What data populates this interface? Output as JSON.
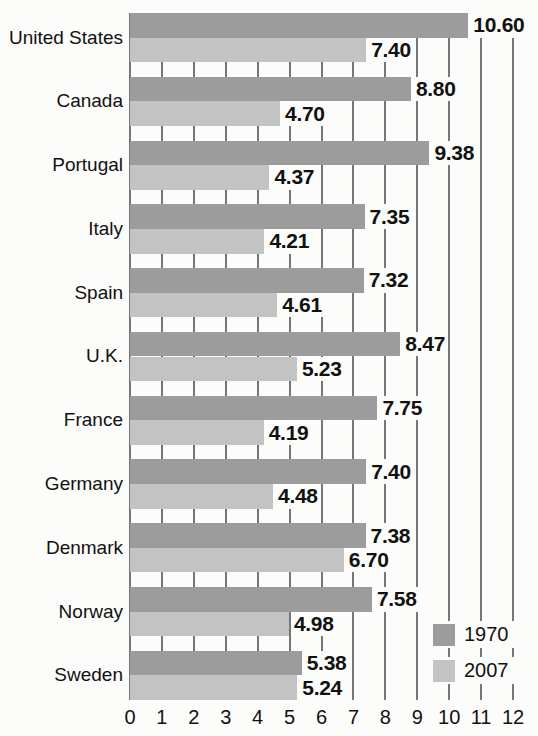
{
  "chart_data": {
    "type": "bar",
    "orientation": "horizontal",
    "title": "",
    "categories": [
      "United States",
      "Canada",
      "Portugal",
      "Italy",
      "Spain",
      "U.K.",
      "France",
      "Germany",
      "Denmark",
      "Norway",
      "Sweden"
    ],
    "series": [
      {
        "name": "1970",
        "color": "#9c9c9c",
        "values": [
          10.6,
          8.8,
          9.38,
          7.35,
          7.32,
          8.47,
          7.75,
          7.4,
          7.38,
          7.58,
          5.38
        ]
      },
      {
        "name": "2007",
        "color": "#c3c3c3",
        "values": [
          7.4,
          4.7,
          4.37,
          4.21,
          4.61,
          5.23,
          4.19,
          4.48,
          6.7,
          4.98,
          5.24
        ]
      }
    ],
    "value_label_decimals": 2,
    "xlim": [
      0,
      12
    ],
    "x_ticks": [
      0,
      1,
      2,
      3,
      4,
      5,
      6,
      7,
      8,
      9,
      10,
      11,
      12
    ],
    "grid": true,
    "legend": {
      "position": "bottom-right",
      "entries": [
        "1970",
        "2007"
      ]
    }
  },
  "colors": {
    "background": "#fcfcfa",
    "gridline": "#767676",
    "text": "#111111",
    "bar_1970": "#9c9c9c",
    "bar_2007": "#c3c3c3"
  }
}
